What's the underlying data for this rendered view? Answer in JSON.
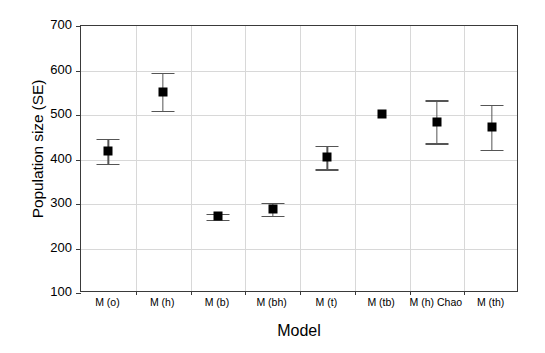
{
  "chart_data": {
    "type": "scatter",
    "title": "",
    "xlabel": "Model",
    "ylabel": "Population size (SE)",
    "categories": [
      "M (o)",
      "M (h)",
      "M (b)",
      "M (bh)",
      "M (t)",
      "M (tb)",
      "M (h) Chao",
      "M (th)"
    ],
    "values": [
      420,
      552,
      272,
      288,
      405,
      503,
      484,
      473
    ],
    "error_upper": [
      447,
      595,
      278,
      303,
      431,
      503,
      533,
      523
    ],
    "error_lower": [
      390,
      510,
      265,
      274,
      378,
      503,
      436,
      422
    ],
    "ylim": [
      100,
      700
    ],
    "yticks": [
      100,
      200,
      300,
      400,
      500,
      600,
      700
    ],
    "ytick_labels": [
      "100",
      "200",
      "300",
      "400",
      "500",
      "600",
      "700"
    ],
    "grid": true,
    "legend": "none",
    "marker_style": "filled-square",
    "marker_color": "#000000",
    "errorbar_color": "#555555",
    "grid_color": "#d8d8d8",
    "axis_color": "#3a3a3a",
    "background": "#ffffff"
  }
}
